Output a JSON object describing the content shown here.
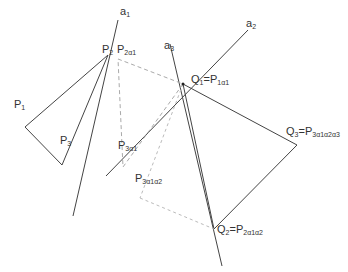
{
  "diagram": {
    "colors": {
      "solid_line": "#444444",
      "dashed_line": "#aaaaaa",
      "label": "#333333"
    },
    "labels": {
      "a1": {
        "base": "a",
        "sub": "1"
      },
      "a2": {
        "base": "a",
        "sub": "2"
      },
      "a3": {
        "base": "a",
        "sub": "3"
      },
      "P1": {
        "base": "P",
        "sub": "1"
      },
      "P2": {
        "base": "P",
        "sub": "2"
      },
      "P3": {
        "base": "P",
        "sub": "3"
      },
      "P2a1": {
        "base": "P",
        "sub": "2α1"
      },
      "P3a1": {
        "base": "P",
        "sub": "3α1"
      },
      "P3a1a2": {
        "base": "P",
        "sub": "3α1α2"
      },
      "Q1": {
        "base": "Q",
        "sub": "1",
        "eq": "=P",
        "eqsub": "1α1"
      },
      "Q2": {
        "base": "Q",
        "sub": "2",
        "eq": "=P",
        "eqsub": "2α1α2"
      },
      "Q3": {
        "base": "Q",
        "sub": "3",
        "eq": "=P",
        "eqsub": "3α1α2α3"
      }
    },
    "points": {
      "P1": [
        25,
        127
      ],
      "P2": [
        108,
        55
      ],
      "P3": [
        62,
        165
      ],
      "Q1": [
        183,
        84
      ],
      "Q2": [
        214,
        229
      ],
      "Q3": [
        297,
        145
      ],
      "P2a1": [
        118,
        59
      ],
      "P3a1": [
        123,
        167
      ],
      "P3a1a2": [
        140,
        198
      ]
    },
    "lines": {
      "a1": [
        [
          118,
          20
        ],
        [
          73,
          216
        ]
      ],
      "a2": [
        [
          248,
          30
        ],
        [
          106,
          176
        ]
      ],
      "a3": [
        [
          170,
          44
        ],
        [
          222,
          266
        ]
      ]
    }
  }
}
